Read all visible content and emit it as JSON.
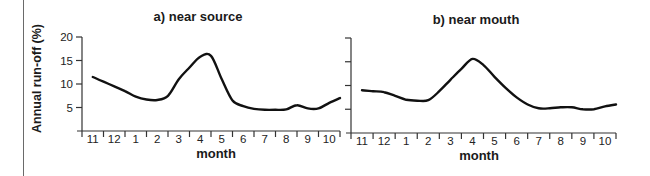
{
  "chart_data": [
    {
      "type": "line",
      "title": "a) near source",
      "xlabel": "month",
      "ylabel": "Annual run-off (%)",
      "ylim": [
        0,
        20
      ],
      "yticks": [
        5,
        10,
        15,
        20
      ],
      "categories": [
        "11",
        "12",
        "1",
        "2",
        "3",
        "4",
        "5",
        "6",
        "7",
        "8",
        "9",
        "10"
      ],
      "series": [
        {
          "name": "near source",
          "x": [
            0.0,
            0.5,
            1.0,
            1.5,
            2.0,
            2.5,
            3.0,
            3.5,
            4.0,
            4.5,
            5.0,
            5.5,
            6.0,
            6.5,
            7.0,
            7.5,
            8.0,
            8.5,
            9.0,
            9.5,
            10.0,
            10.5,
            11.0,
            11.5
          ],
          "values": [
            11.5,
            10.5,
            9.5,
            8.5,
            7.3,
            6.7,
            6.6,
            7.5,
            11.0,
            13.5,
            15.8,
            16.0,
            11.0,
            6.5,
            5.3,
            4.7,
            4.5,
            4.5,
            4.6,
            5.5,
            4.8,
            4.8,
            6.0,
            7.0
          ]
        }
      ]
    },
    {
      "type": "line",
      "title": "b) near mouth",
      "xlabel": "month",
      "ylabel": "",
      "ylim": [
        0,
        20
      ],
      "yticks": [
        5,
        10,
        15,
        20
      ],
      "categories": [
        "11",
        "12",
        "1",
        "2",
        "3",
        "4",
        "5",
        "6",
        "7",
        "8",
        "9",
        "10"
      ],
      "series": [
        {
          "name": "near mouth",
          "x": [
            0.0,
            0.5,
            1.0,
            1.5,
            2.0,
            2.5,
            3.0,
            3.5,
            4.0,
            4.5,
            5.0,
            5.5,
            6.0,
            6.5,
            7.0,
            7.5,
            8.0,
            8.5,
            9.0,
            9.5,
            10.0,
            10.5,
            11.0,
            11.5
          ],
          "values": [
            9.0,
            8.8,
            8.6,
            7.8,
            7.0,
            6.8,
            6.9,
            8.8,
            11.2,
            13.5,
            15.6,
            14.3,
            11.8,
            9.5,
            7.5,
            6.0,
            5.2,
            5.2,
            5.4,
            5.4,
            5.0,
            5.0,
            5.6,
            6.0
          ]
        }
      ]
    }
  ]
}
